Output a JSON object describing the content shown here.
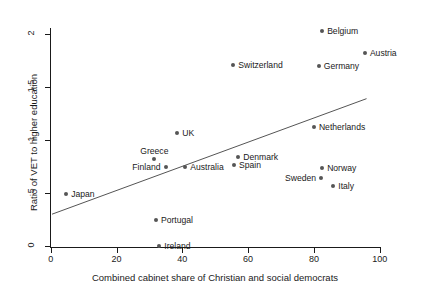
{
  "chart_data": {
    "type": "scatter",
    "title": "",
    "xlabel": "Combined cabinet share of Christian and social democrats",
    "ylabel": "Ratio of VET to higher education",
    "xlim": [
      0,
      100
    ],
    "ylim": [
      0,
      2.2
    ],
    "xticks": [
      0,
      20,
      40,
      60,
      80,
      100
    ],
    "xtick_labels": [
      "0",
      "20",
      "40",
      "60",
      "80",
      "100"
    ],
    "yticks": [
      0,
      0.5,
      1,
      1.5,
      2
    ],
    "ytick_labels": [
      "0",
      ".5",
      "1",
      "1.5",
      "2"
    ],
    "grid": false,
    "legend": "none",
    "marker_color": "#555555",
    "line_color": "#555555",
    "points": [
      {
        "label": "Belgium",
        "x": 82.5,
        "y": 2.03,
        "label_pos": "right"
      },
      {
        "label": "Austria",
        "x": 95.5,
        "y": 1.82,
        "label_pos": "right"
      },
      {
        "label": "Germany",
        "x": 81.5,
        "y": 1.7,
        "label_pos": "right"
      },
      {
        "label": "Switzerland",
        "x": 55.5,
        "y": 1.71,
        "label_pos": "right"
      },
      {
        "label": "Netherlands",
        "x": 80.0,
        "y": 1.12,
        "label_pos": "right"
      },
      {
        "label": "UK",
        "x": 38.5,
        "y": 1.07,
        "label_pos": "right"
      },
      {
        "label": "Greece",
        "x": 31.5,
        "y": 0.82,
        "label_pos": "above"
      },
      {
        "label": "Denmark",
        "x": 57.0,
        "y": 0.84,
        "label_pos": "right"
      },
      {
        "label": "Finland",
        "x": 34.9,
        "y": 0.75,
        "label_pos": "left"
      },
      {
        "label": "Australia",
        "x": 40.9,
        "y": 0.75,
        "label_pos": "right"
      },
      {
        "label": "Spain",
        "x": 55.7,
        "y": 0.76,
        "label_pos": "right"
      },
      {
        "label": "Norway",
        "x": 82.5,
        "y": 0.74,
        "label_pos": "right"
      },
      {
        "label": "Sweden",
        "x": 82.2,
        "y": 0.64,
        "label_pos": "left"
      },
      {
        "label": "Italy",
        "x": 85.9,
        "y": 0.57,
        "label_pos": "right"
      },
      {
        "label": "Japan",
        "x": 4.7,
        "y": 0.49,
        "label_pos": "right"
      },
      {
        "label": "Portugal",
        "x": 32.0,
        "y": 0.25,
        "label_pos": "right"
      },
      {
        "label": "Ireland",
        "x": 33.0,
        "y": 0.0,
        "label_pos": "right"
      }
    ],
    "fit_line": {
      "x0": 0.4,
      "y0": 0.3,
      "x1": 96.0,
      "y1": 1.39
    }
  }
}
